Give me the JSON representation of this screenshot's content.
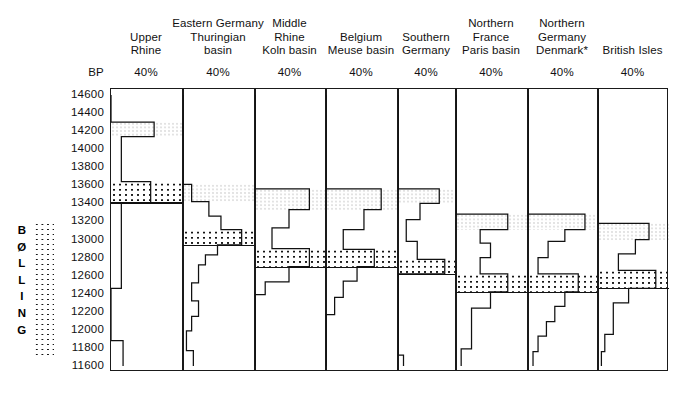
{
  "figure": {
    "axis_label": "BP",
    "zone_label": "BØLLING",
    "zone_letters": [
      "B",
      "Ø",
      "L",
      "L",
      "I",
      "N",
      "G"
    ],
    "percent_label": "40%",
    "ink_color": "#111111",
    "frame_color": "#1a1a1a",
    "background": "#ffffff"
  },
  "y_axis": {
    "label": "BP",
    "unit": "radiocarbon years BP",
    "top": 14600,
    "bottom": 11600,
    "step": 200,
    "ticks": [
      14600,
      14400,
      14200,
      14000,
      13800,
      13600,
      13400,
      13200,
      13000,
      12800,
      12600,
      12400,
      12200,
      12000,
      11800,
      11600
    ]
  },
  "columns": [
    {
      "id": "upper-rhine",
      "title": "Upper\nRhine",
      "scale": "40%"
    },
    {
      "id": "eastern-germany",
      "title": "Eastern Germany\nThuringian\nbasin",
      "scale": "40%"
    },
    {
      "id": "middle-rhine",
      "title": "Middle\nRhine\nKoln basin",
      "scale": "40%"
    },
    {
      "id": "belgium",
      "title": "Belgium\nMeuse basin",
      "scale": "40%"
    },
    {
      "id": "southern-germany",
      "title": "Southern\nGermany",
      "scale": "40%"
    },
    {
      "id": "northern-france",
      "title": "Northern\nFrance\nParis basin",
      "scale": "40%"
    },
    {
      "id": "northern-germany",
      "title": "Northern\nGermany\nDenmark*",
      "scale": "40%"
    },
    {
      "id": "british-isles",
      "title": "British Isles",
      "scale": "40%"
    }
  ],
  "chart_data": {
    "type": "area",
    "xlabel": "",
    "ylabel": "BP",
    "ylim": [
      11600,
      14600
    ],
    "grid": false,
    "legend": "BØLLING zone marked by stipple",
    "series": [
      {
        "name": "Upper Rhine",
        "steps": [
          {
            "bp_top": 14600,
            "bp_bottom": 14300,
            "pct": 0
          },
          {
            "bp_top": 14300,
            "bp_bottom": 14140,
            "pct": 25
          },
          {
            "bp_top": 14140,
            "bp_bottom": 13640,
            "pct": 6
          },
          {
            "bp_top": 13640,
            "bp_bottom": 13410,
            "pct": 23
          },
          {
            "bp_top": 13410,
            "bp_bottom": 12460,
            "pct": 6
          },
          {
            "bp_top": 12460,
            "bp_bottom": 11880,
            "pct": 0
          },
          {
            "bp_top": 11880,
            "bp_bottom": 11600,
            "pct": 7
          }
        ],
        "light_band": {
          "bp_top": 14300,
          "bp_bottom": 14140
        },
        "dense_band": {
          "bp_top": 13640,
          "bp_bottom": 13410
        }
      },
      {
        "name": "Eastern Germany Thuringian basin",
        "steps": [
          {
            "bp_top": 14600,
            "bp_bottom": 13610,
            "pct": 0
          },
          {
            "bp_top": 13610,
            "bp_bottom": 13420,
            "pct": 5
          },
          {
            "bp_top": 13420,
            "bp_bottom": 13260,
            "pct": 15
          },
          {
            "bp_top": 13260,
            "bp_bottom": 13110,
            "pct": 22
          },
          {
            "bp_top": 13110,
            "bp_bottom": 12940,
            "pct": 34
          },
          {
            "bp_top": 12940,
            "bp_bottom": 12830,
            "pct": 20
          },
          {
            "bp_top": 12830,
            "bp_bottom": 12720,
            "pct": 13
          },
          {
            "bp_top": 12720,
            "bp_bottom": 12520,
            "pct": 9
          },
          {
            "bp_top": 12520,
            "bp_bottom": 12320,
            "pct": 5
          },
          {
            "bp_top": 12320,
            "bp_bottom": 12150,
            "pct": 9
          },
          {
            "bp_top": 12150,
            "bp_bottom": 11990,
            "pct": 5
          },
          {
            "bp_top": 11990,
            "bp_bottom": 11770,
            "pct": 2
          },
          {
            "bp_top": 11770,
            "bp_bottom": 11600,
            "pct": 6
          }
        ],
        "light_band": {
          "bp_top": 13610,
          "bp_bottom": 13420
        },
        "dense_band": {
          "bp_top": 13110,
          "bp_bottom": 12940
        }
      },
      {
        "name": "Middle Rhine Koln basin",
        "steps": [
          {
            "bp_top": 14600,
            "bp_bottom": 13560,
            "pct": 0
          },
          {
            "bp_top": 13560,
            "bp_bottom": 13330,
            "pct": 32
          },
          {
            "bp_top": 13330,
            "bp_bottom": 13130,
            "pct": 20
          },
          {
            "bp_top": 13130,
            "bp_bottom": 12900,
            "pct": 10
          },
          {
            "bp_top": 12900,
            "bp_bottom": 12700,
            "pct": 32
          },
          {
            "bp_top": 12700,
            "bp_bottom": 12530,
            "pct": 20
          },
          {
            "bp_top": 12530,
            "bp_bottom": 12390,
            "pct": 6
          },
          {
            "bp_top": 12390,
            "bp_bottom": 11600,
            "pct": 0
          }
        ],
        "light_band": {
          "bp_top": 13560,
          "bp_bottom": 13330
        },
        "dense_band": {
          "bp_top": 12900,
          "bp_bottom": 12700
        }
      },
      {
        "name": "Belgium Meuse basin",
        "steps": [
          {
            "bp_top": 14600,
            "bp_bottom": 13560,
            "pct": 0
          },
          {
            "bp_top": 13560,
            "bp_bottom": 13330,
            "pct": 32
          },
          {
            "bp_top": 13330,
            "bp_bottom": 13110,
            "pct": 22
          },
          {
            "bp_top": 13110,
            "bp_bottom": 12890,
            "pct": 10
          },
          {
            "bp_top": 12890,
            "bp_bottom": 12700,
            "pct": 28
          },
          {
            "bp_top": 12700,
            "bp_bottom": 12540,
            "pct": 18
          },
          {
            "bp_top": 12540,
            "bp_bottom": 12360,
            "pct": 10
          },
          {
            "bp_top": 12360,
            "bp_bottom": 12170,
            "pct": 5
          },
          {
            "bp_top": 12170,
            "bp_bottom": 11600,
            "pct": 0
          }
        ],
        "light_band": {
          "bp_top": 13560,
          "bp_bottom": 13330
        },
        "dense_band": {
          "bp_top": 12890,
          "bp_bottom": 12700
        }
      },
      {
        "name": "Southern Germany",
        "steps": [
          {
            "bp_top": 14600,
            "bp_bottom": 13560,
            "pct": 0
          },
          {
            "bp_top": 13560,
            "bp_bottom": 13400,
            "pct": 30
          },
          {
            "bp_top": 13400,
            "bp_bottom": 13220,
            "pct": 16
          },
          {
            "bp_top": 13220,
            "bp_bottom": 12980,
            "pct": 6
          },
          {
            "bp_top": 12980,
            "bp_bottom": 12780,
            "pct": 14
          },
          {
            "bp_top": 12780,
            "bp_bottom": 12620,
            "pct": 34
          },
          {
            "bp_top": 12620,
            "bp_bottom": 11720,
            "pct": 0
          },
          {
            "bp_top": 11720,
            "bp_bottom": 11600,
            "pct": 4
          }
        ],
        "light_band": {
          "bp_top": 13560,
          "bp_bottom": 13400
        },
        "dense_band": {
          "bp_top": 12780,
          "bp_bottom": 12620
        }
      },
      {
        "name": "Northern France Paris basin",
        "steps": [
          {
            "bp_top": 14600,
            "bp_bottom": 13280,
            "pct": 0
          },
          {
            "bp_top": 13280,
            "bp_bottom": 13110,
            "pct": 30
          },
          {
            "bp_top": 13110,
            "bp_bottom": 12960,
            "pct": 14
          },
          {
            "bp_top": 12960,
            "bp_bottom": 12800,
            "pct": 20
          },
          {
            "bp_top": 12800,
            "bp_bottom": 12620,
            "pct": 14
          },
          {
            "bp_top": 12620,
            "bp_bottom": 12420,
            "pct": 30
          },
          {
            "bp_top": 12420,
            "bp_bottom": 12240,
            "pct": 20
          },
          {
            "bp_top": 12240,
            "bp_bottom": 11790,
            "pct": 9
          },
          {
            "bp_top": 11790,
            "bp_bottom": 11600,
            "pct": 3
          }
        ],
        "light_band": {
          "bp_top": 13280,
          "bp_bottom": 13110
        },
        "dense_band": {
          "bp_top": 12620,
          "bp_bottom": 12420
        }
      },
      {
        "name": "Northern Germany Denmark",
        "steps": [
          {
            "bp_top": 14600,
            "bp_bottom": 13280,
            "pct": 0
          },
          {
            "bp_top": 13280,
            "bp_bottom": 13110,
            "pct": 34
          },
          {
            "bp_top": 13110,
            "bp_bottom": 12980,
            "pct": 22
          },
          {
            "bp_top": 12980,
            "bp_bottom": 12800,
            "pct": 12
          },
          {
            "bp_top": 12800,
            "bp_bottom": 12620,
            "pct": 6
          },
          {
            "bp_top": 12620,
            "bp_bottom": 12420,
            "pct": 30
          },
          {
            "bp_top": 12420,
            "bp_bottom": 12260,
            "pct": 22
          },
          {
            "bp_top": 12260,
            "bp_bottom": 12090,
            "pct": 16
          },
          {
            "bp_top": 12090,
            "bp_bottom": 11930,
            "pct": 11
          },
          {
            "bp_top": 11930,
            "bp_bottom": 11760,
            "pct": 6
          },
          {
            "bp_top": 11760,
            "bp_bottom": 11600,
            "pct": 3
          }
        ],
        "light_band": {
          "bp_top": 13280,
          "bp_bottom": 13110
        },
        "dense_band": {
          "bp_top": 12620,
          "bp_bottom": 12420
        }
      },
      {
        "name": "British Isles",
        "steps": [
          {
            "bp_top": 14600,
            "bp_bottom": 13180,
            "pct": 0
          },
          {
            "bp_top": 13180,
            "bp_bottom": 13000,
            "pct": 30
          },
          {
            "bp_top": 13000,
            "bp_bottom": 12840,
            "pct": 22
          },
          {
            "bp_top": 12840,
            "bp_bottom": 12660,
            "pct": 12
          },
          {
            "bp_top": 12660,
            "bp_bottom": 12460,
            "pct": 34
          },
          {
            "bp_top": 12460,
            "bp_bottom": 12300,
            "pct": 18
          },
          {
            "bp_top": 12300,
            "bp_bottom": 11950,
            "pct": 9
          },
          {
            "bp_top": 11950,
            "bp_bottom": 11760,
            "pct": 4
          },
          {
            "bp_top": 11760,
            "bp_bottom": 11600,
            "pct": 2
          }
        ],
        "light_band": {
          "bp_top": 13180,
          "bp_bottom": 13000
        },
        "dense_band": {
          "bp_top": 12660,
          "bp_bottom": 12460
        }
      }
    ]
  }
}
